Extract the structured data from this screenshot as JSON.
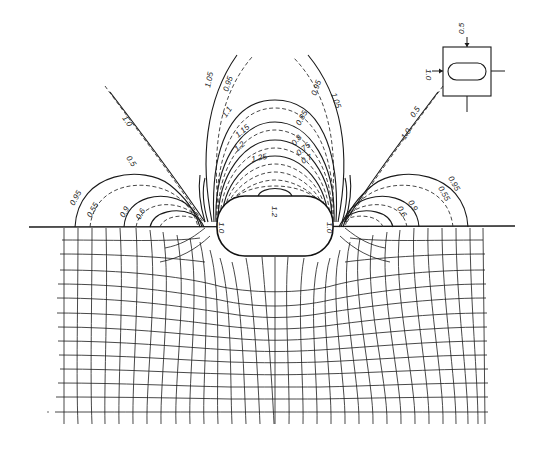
{
  "figure": {
    "colors": {
      "ink": "#1a1a1a",
      "background": "#ffffff"
    }
  },
  "inset": {
    "label_top": "0.5",
    "label_left": "1.0",
    "arrows": [
      "top",
      "left",
      "right",
      "bottom"
    ]
  },
  "hole": {
    "label_top": "1.2",
    "label_left": "1.0",
    "label_right": "1.0"
  },
  "contours": {
    "solid": [
      {
        "id": "c105",
        "label": "1.05"
      },
      {
        "id": "c110",
        "label": "1.1"
      },
      {
        "id": "c115",
        "label": "1.15"
      },
      {
        "id": "c120",
        "label": "1.2"
      },
      {
        "id": "c125",
        "label": "1.25"
      },
      {
        "id": "l095",
        "label": "0.95"
      },
      {
        "id": "l090",
        "label": "0.9"
      },
      {
        "id": "r095",
        "label": "0.95"
      },
      {
        "id": "r090",
        "label": "0.9"
      }
    ],
    "dashed": [
      {
        "id": "d095",
        "label": "0.95"
      },
      {
        "id": "d085",
        "label": "0.85"
      },
      {
        "id": "d080",
        "label": "0.8"
      },
      {
        "id": "d075",
        "label": "0.75"
      },
      {
        "id": "d070",
        "label": "0.7"
      },
      {
        "id": "ld055",
        "label": "0.55"
      },
      {
        "id": "ld060",
        "label": "0.6"
      },
      {
        "id": "rd055",
        "label": "0.55"
      },
      {
        "id": "rd060",
        "label": "0.6"
      }
    ],
    "diagonals": {
      "left": {
        "label_a": "0.5",
        "label_b": "1.0"
      },
      "right": {
        "label_a": "0.5",
        "label_b": "1.0"
      }
    },
    "right_labels": {
      "outer": "1.05",
      "dashed_outer": "0.95"
    }
  }
}
